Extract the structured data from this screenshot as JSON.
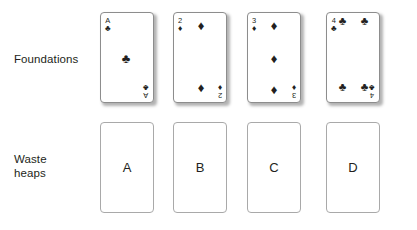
{
  "diagram": {
    "background_color": "#ffffff",
    "ink_color": "#231f20",
    "rows": [
      {
        "id": "foundations",
        "label": "Foundations",
        "kind": "foundation",
        "cards": [
          {
            "id": "foundation-ace-clubs",
            "rank": "A",
            "suit": "clubs",
            "suit_glyph": "♣",
            "suit_color": "#231f20",
            "pip_count": 1,
            "name": "Ace of Clubs",
            "index_corners": [
              "top-left",
              "bottom-right"
            ]
          },
          {
            "id": "foundation-two-diamonds",
            "rank": "2",
            "suit": "diamonds",
            "suit_glyph": "♦",
            "suit_color": "#231f20",
            "pip_count": 2,
            "name": "Two of Diamonds",
            "index_corners": [
              "top-left",
              "bottom-right"
            ]
          },
          {
            "id": "foundation-three-diamonds",
            "rank": "3",
            "suit": "diamonds",
            "suit_glyph": "♦",
            "suit_color": "#231f20",
            "pip_count": 3,
            "name": "Three of Diamonds",
            "index_corners": [
              "top-left",
              "bottom-right"
            ]
          },
          {
            "id": "foundation-four-clubs",
            "rank": "4",
            "suit": "clubs",
            "suit_glyph": "♣",
            "suit_color": "#231f20",
            "pip_count": 4,
            "name": "Four of Clubs",
            "index_corners": [
              "top-left",
              "bottom-right"
            ]
          }
        ]
      },
      {
        "id": "waste-heaps",
        "label": "Waste\nheaps",
        "kind": "empty-slot",
        "cards": [
          {
            "id": "waste-a",
            "letter": "A",
            "name": "Waste heap A"
          },
          {
            "id": "waste-b",
            "letter": "B",
            "name": "Waste heap B"
          },
          {
            "id": "waste-c",
            "letter": "C",
            "name": "Waste heap C"
          },
          {
            "id": "waste-d",
            "letter": "D",
            "name": "Waste heap D"
          }
        ]
      }
    ]
  }
}
